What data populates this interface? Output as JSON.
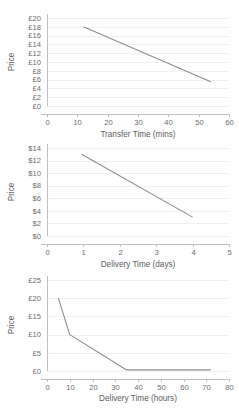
{
  "page": {
    "clipped_header_text": "",
    "background_color": "#ffffff",
    "line_color": "#8b8b90",
    "grid_color": "#f0f0f2",
    "axis_color": "#bfbfc3",
    "text_color": "#6a6b6e"
  },
  "chart_data": [
    {
      "id": "transfer-time-price",
      "type": "line",
      "title": "",
      "xlabel": "Transfer Time (mins)",
      "ylabel": "Price",
      "xlim": [
        0,
        60
      ],
      "ylim": [
        0,
        20
      ],
      "xticks": [
        0,
        10,
        20,
        30,
        40,
        50,
        60
      ],
      "xtick_labels": [
        "0",
        "10",
        "20",
        "30",
        "40",
        "50",
        "60"
      ],
      "yticks": [
        0,
        2,
        4,
        6,
        8,
        10,
        12,
        14,
        16,
        18,
        20
      ],
      "ytick_labels": [
        "£0",
        "£2",
        "£4",
        "£6",
        "£8",
        "£10",
        "£12",
        "£14",
        "£16",
        "£18",
        "£20"
      ],
      "grid": true,
      "legend": "none",
      "currency": "£",
      "series": [
        {
          "name": "Price vs Transfer Time",
          "color": "#8b8b90",
          "points": [
            [
              12,
              18
            ],
            [
              54,
              5.5
            ]
          ]
        }
      ]
    },
    {
      "id": "delivery-time-days-price",
      "type": "line",
      "title": "",
      "xlabel": "Delivery Time (days)",
      "ylabel": "Price",
      "xlim": [
        0,
        5
      ],
      "ylim": [
        0,
        14
      ],
      "xticks": [
        0,
        1,
        2,
        3,
        4,
        5
      ],
      "xtick_labels": [
        "0",
        "1",
        "2",
        "3",
        "4",
        "5"
      ],
      "yticks": [
        0,
        2,
        4,
        6,
        8,
        10,
        12,
        14
      ],
      "ytick_labels": [
        "$0",
        "$2",
        "$4",
        "$6",
        "$8",
        "$10",
        "$12",
        "$14"
      ],
      "grid": true,
      "legend": "none",
      "currency": "$",
      "series": [
        {
          "name": "Price vs Delivery Time (days)",
          "color": "#8b8b90",
          "points": [
            [
              0.95,
              13
            ],
            [
              4.0,
              3.0
            ]
          ]
        }
      ]
    },
    {
      "id": "delivery-time-hours-price",
      "type": "line",
      "title": "",
      "xlabel": "Delivery Time (hours)",
      "ylabel": "Price",
      "xlim": [
        0,
        80
      ],
      "ylim": [
        0,
        25
      ],
      "xticks": [
        0,
        10,
        20,
        30,
        40,
        50,
        60,
        70,
        80
      ],
      "xtick_labels": [
        "0",
        "10",
        "20",
        "30",
        "40",
        "50",
        "60",
        "70",
        "80"
      ],
      "yticks": [
        0,
        5,
        10,
        15,
        20,
        25
      ],
      "ytick_labels": [
        "£0",
        "£5",
        "£10",
        "£15",
        "£20",
        "£25"
      ],
      "grid": true,
      "legend": "none",
      "currency": "£",
      "series": [
        {
          "name": "Price vs Delivery Time (hours)",
          "color": "#8b8b90",
          "points": [
            [
              5,
              20
            ],
            [
              10,
              10
            ],
            [
              35,
              0.3
            ],
            [
              72,
              0.3
            ]
          ]
        }
      ]
    }
  ]
}
